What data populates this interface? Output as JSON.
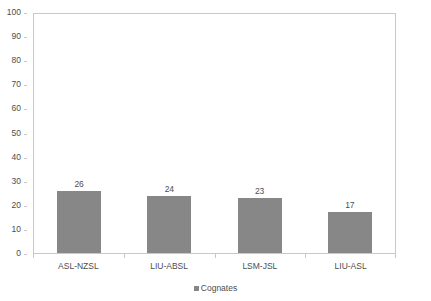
{
  "chart_data": {
    "type": "bar",
    "title": "",
    "subtitle": "",
    "xlabel": "",
    "ylabel": "",
    "categories": [
      "ASL-NZSL",
      "LIU-ABSL",
      "LSM-JSL",
      "LIU-ASL"
    ],
    "series": [
      {
        "name": "Cognates",
        "values": [
          26,
          24,
          23,
          17
        ],
        "color": "#878787"
      }
    ],
    "values": [
      26,
      24,
      23,
      17
    ],
    "data_labels": [
      "26",
      "24",
      "23",
      "17"
    ],
    "ylim": [
      0,
      100
    ],
    "y_tick_step": 10,
    "y_ticks": [
      100,
      90,
      80,
      70,
      60,
      50,
      40,
      30,
      20,
      10,
      0
    ],
    "y_tick_labels": [
      "100",
      "90",
      "80",
      "70",
      "60",
      "50",
      "40",
      "30",
      "20",
      "10",
      "0"
    ],
    "grid": false,
    "plot_border": true,
    "legend_position": "bottom",
    "legend": [
      {
        "label": "Cognates",
        "color": "#878787"
      }
    ]
  },
  "style": {
    "bar_color": "#878787",
    "axis_color": "#c8c8c8",
    "text_color": "#4d4d4d",
    "background": "#ffffff"
  }
}
